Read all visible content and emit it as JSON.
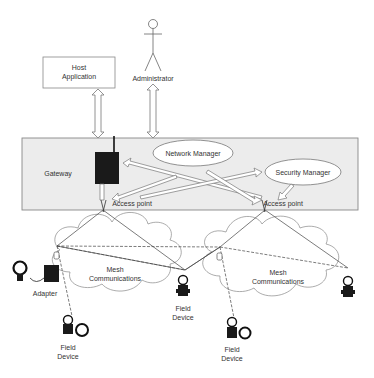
{
  "diagram": {
    "host_application": {
      "line1": "Host",
      "line2": "Application"
    },
    "administrator": {
      "label": "Administrator"
    },
    "gateway_band": {
      "gateway_label": "Gateway",
      "network_manager_label": "Network Manager",
      "security_manager_label": "Security Manager",
      "access_point_left_label": "Access point",
      "access_point_right_label": "Access point"
    },
    "mesh_left": {
      "line1": "Mesh",
      "line2": "Communications"
    },
    "mesh_right": {
      "line1": "Mesh",
      "line2": "Communications"
    },
    "adapter_label": "Adapter",
    "field_devices": [
      {
        "line1": "Field",
        "line2": "Device"
      },
      {
        "line1": "Field",
        "line2": "Device"
      },
      {
        "line1": "Field",
        "line2": "Device"
      }
    ],
    "colors": {
      "band_fill": "#ececec",
      "band_stroke": "#888888",
      "device_fill": "#1a1a1a",
      "line": "#444444"
    }
  }
}
